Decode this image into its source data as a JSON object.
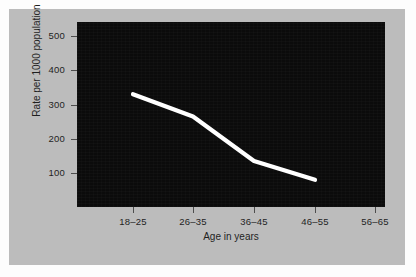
{
  "figure": {
    "background_color": "#bcbcbc",
    "plot_background_color": "#0b0b0b",
    "line_color": "#ffffff",
    "axis_text_color": "#1f1f1f"
  },
  "chart_data": {
    "type": "line",
    "title": "",
    "subtitle": "",
    "xlabel": "Age in years",
    "ylabel": "Rate per 1000 population",
    "categories": [
      "18–25",
      "26–35",
      "36–45",
      "46–55",
      "56–65"
    ],
    "values": [
      330,
      265,
      135,
      80,
      null
    ],
    "series": [
      {
        "name": "Rate",
        "values": [
          330,
          265,
          135,
          80,
          null
        ]
      }
    ],
    "ylim": [
      0,
      560
    ],
    "ytick_labels": [
      "100",
      "200",
      "300",
      "400",
      "500"
    ],
    "ytick_values": [
      100,
      200,
      300,
      400,
      500
    ],
    "xtick_labels": [
      "18–25",
      "26–35",
      "36–45",
      "46–55",
      "56–65"
    ],
    "grid": false,
    "legend": false,
    "legend_position": "none",
    "annotations": []
  }
}
